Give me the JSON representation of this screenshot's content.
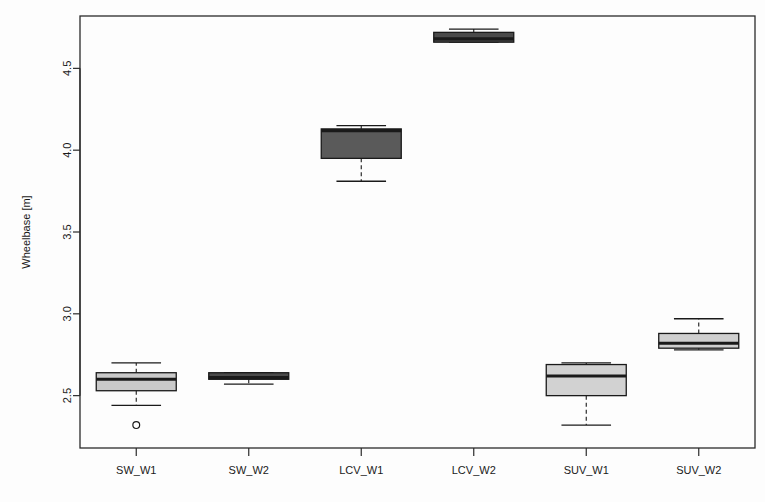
{
  "chart_data": {
    "type": "box",
    "title": "",
    "xlabel": "",
    "ylabel": "Wheelbase [m]",
    "categories": [
      "SW_W1",
      "SW_W2",
      "LCV_W1",
      "LCV_W2",
      "SUV_W1",
      "SUV_W2"
    ],
    "ylim": [
      2.18,
      4.82
    ],
    "yticks": [
      2.5,
      3.0,
      3.5,
      4.0,
      4.5
    ],
    "ytick_labels": [
      "2.5",
      "3.0",
      "3.5",
      "4.0",
      "4.5"
    ],
    "grid": false,
    "legend": "none",
    "boxes": [
      {
        "category": "SW_W1",
        "whisker_low": 2.44,
        "q1": 2.53,
        "median": 2.6,
        "q3": 2.64,
        "whisker_high": 2.7,
        "outliers": [
          2.32
        ],
        "fill": "#c9c9c9"
      },
      {
        "category": "SW_W2",
        "whisker_low": 2.57,
        "q1": 2.6,
        "median": 2.61,
        "q3": 2.64,
        "whisker_high": 2.64,
        "outliers": [],
        "fill": "#4a4a4a"
      },
      {
        "category": "LCV_W1",
        "whisker_low": 3.81,
        "q1": 3.95,
        "median": 4.12,
        "q3": 4.13,
        "whisker_high": 4.15,
        "outliers": [],
        "fill": "#5a5a5a"
      },
      {
        "category": "LCV_W2",
        "whisker_low": 4.66,
        "q1": 4.66,
        "median": 4.68,
        "q3": 4.72,
        "whisker_high": 4.74,
        "outliers": [],
        "fill": "#4a4a4a"
      },
      {
        "category": "SUV_W1",
        "whisker_low": 2.32,
        "q1": 2.5,
        "median": 2.62,
        "q3": 2.69,
        "whisker_high": 2.7,
        "outliers": [],
        "fill": "#d2d2d2"
      },
      {
        "category": "SUV_W2",
        "whisker_low": 2.78,
        "q1": 2.79,
        "median": 2.82,
        "q3": 2.88,
        "whisker_high": 2.97,
        "outliers": [],
        "fill": "#cfcfcf"
      }
    ],
    "colors": {
      "frame": "#2b2b2b",
      "line": "#1a1a1a",
      "text": "#1a1a1a",
      "background": "#fdfdfd"
    }
  }
}
